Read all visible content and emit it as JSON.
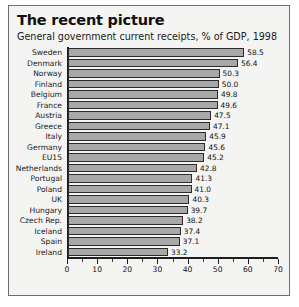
{
  "chart_data": {
    "type": "bar",
    "orientation": "horizontal",
    "title": "The recent picture",
    "subtitle": "General government current receipts, % of GDP, 1998",
    "xlabel": "",
    "ylabel": "",
    "xlim": [
      0,
      70
    ],
    "xticks": [
      0,
      10,
      20,
      30,
      40,
      50,
      60,
      70
    ],
    "xtick_labels": [
      "0",
      "10",
      "20",
      "30",
      "40",
      "50",
      "60",
      "70"
    ],
    "minor_tick_step": 5,
    "grid": false,
    "legend": false,
    "bar_fill": "#a8a8a8",
    "bar_border": "#2b2b2b",
    "categories": [
      "Sweden",
      "Denmark",
      "Norway",
      "Finland",
      "Belgium",
      "France",
      "Austria",
      "Greece",
      "Italy",
      "Germany",
      "EU15",
      "Netherlands",
      "Portugal",
      "Poland",
      "UK",
      "Hungary",
      "Czech Rep.",
      "Iceland",
      "Spain",
      "Ireland"
    ],
    "values": [
      58.5,
      56.4,
      50.3,
      50.0,
      49.8,
      49.6,
      47.5,
      47.1,
      45.9,
      45.6,
      45.2,
      42.8,
      41.3,
      41.0,
      40.3,
      39.7,
      38.2,
      37.4,
      37.1,
      33.2
    ],
    "value_labels": [
      "58.5",
      "56.4",
      "50.3",
      "50.0",
      "49.8",
      "49.6",
      "47.5",
      "47.1",
      "45.9",
      "45.6",
      "45.2",
      "42.8",
      "41.3",
      "41.0",
      "40.3",
      "39.7",
      "38.2",
      "37.4",
      "37.1",
      "33.2"
    ]
  }
}
